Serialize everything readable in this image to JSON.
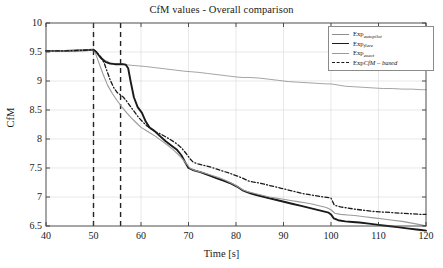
{
  "chart_data": {
    "type": "line",
    "title": "CfM values - Overall comparison",
    "xlabel": "Time [s]",
    "ylabel": "CfM",
    "xlim": [
      40,
      120
    ],
    "ylim": [
      6.5,
      10
    ],
    "xticks": [
      40,
      50,
      60,
      70,
      80,
      90,
      100,
      110,
      120
    ],
    "yticks": [
      6.5,
      7,
      7.5,
      8,
      8.5,
      9,
      9.5,
      10
    ],
    "xtick_labels": [
      "40",
      "50",
      "60",
      "70",
      "80",
      "90",
      "100",
      "110",
      "120"
    ],
    "ytick_labels": [
      "6.5",
      "7",
      "7.5",
      "8",
      "8.5",
      "9",
      "9.5",
      "10"
    ],
    "grid": true,
    "legend_position": "top-right",
    "annotations": [
      {
        "type": "vline",
        "x": 50,
        "style": "dashed",
        "color": "#222222"
      },
      {
        "type": "vline",
        "x": 55.7,
        "style": "dashed",
        "color": "#222222"
      }
    ],
    "series": [
      {
        "name": "Exp_autopilot",
        "label_main": "Exp",
        "label_sub": "autopilot",
        "color": "#8d8d8d",
        "width": 0.8,
        "dash": "solid",
        "x": [
          40,
          44,
          48,
          50,
          50.6,
          51.4,
          52.4,
          53.4,
          54.4,
          55.4,
          56.2,
          57.0,
          58.0,
          59.5,
          61,
          63,
          65,
          67,
          69,
          70.5,
          72,
          74,
          76,
          78,
          80,
          81.5,
          83,
          85,
          87,
          89,
          91,
          93,
          95,
          97,
          99,
          100,
          101.5,
          103,
          105,
          107,
          109,
          111,
          113,
          115,
          117,
          119,
          120
        ],
        "y": [
          9.52,
          9.52,
          9.53,
          9.54,
          9.5,
          9.42,
          9.36,
          9.32,
          9.3,
          9.29,
          9.29,
          9.28,
          9.27,
          9.26,
          9.25,
          9.23,
          9.21,
          9.19,
          9.17,
          9.16,
          9.15,
          9.13,
          9.11,
          9.09,
          9.07,
          9.06,
          9.06,
          9.05,
          9.03,
          9.01,
          8.99,
          8.98,
          8.97,
          8.96,
          8.95,
          8.95,
          8.93,
          8.91,
          8.9,
          8.89,
          8.88,
          8.87,
          8.87,
          8.86,
          8.86,
          8.85,
          8.85
        ]
      },
      {
        "name": "Exp_flare",
        "label_main": "Exp",
        "label_sub": "flare",
        "color": "#1a1a1a",
        "width": 1.9,
        "dash": "solid",
        "x": [
          40,
          44,
          48,
          50,
          50.6,
          51.5,
          52.5,
          53.5,
          54.5,
          55.4,
          56.2,
          56.8,
          57.3,
          57.8,
          58.5,
          59.3,
          60.2,
          61,
          61.8,
          62.8,
          64,
          65.2,
          66.5,
          67.5,
          68.5,
          69.3,
          70,
          70.8,
          71.5,
          72.5,
          73.5,
          74.5,
          76,
          77.5,
          79,
          80.2,
          81.3,
          82.2,
          83.2,
          84.5,
          86,
          87.5,
          89,
          90.5,
          92,
          93.5,
          95,
          96.5,
          98,
          99.5,
          100,
          100.6,
          101.5,
          103,
          104.5,
          106,
          108,
          110,
          112,
          114,
          116,
          118,
          119,
          120
        ],
        "y": [
          9.52,
          9.52,
          9.53,
          9.54,
          9.5,
          9.4,
          9.33,
          9.3,
          9.29,
          9.29,
          9.29,
          9.28,
          9.22,
          9.0,
          8.72,
          8.55,
          8.45,
          8.3,
          8.2,
          8.14,
          8.05,
          7.96,
          7.88,
          7.82,
          7.72,
          7.6,
          7.5,
          7.47,
          7.45,
          7.43,
          7.4,
          7.37,
          7.32,
          7.28,
          7.23,
          7.18,
          7.12,
          7.09,
          7.06,
          7.03,
          7.0,
          6.97,
          6.94,
          6.91,
          6.88,
          6.85,
          6.82,
          6.79,
          6.76,
          6.73,
          6.7,
          6.63,
          6.6,
          6.58,
          6.57,
          6.56,
          6.54,
          6.52,
          6.5,
          6.48,
          6.46,
          6.44,
          6.43,
          6.42
        ]
      },
      {
        "name": "Exp_exact",
        "label_main": "Exp",
        "label_sub": "exact",
        "color": "#9a9a9a",
        "width": 1.1,
        "dash": "solid",
        "x": [
          40,
          44,
          48,
          50,
          50.5,
          51.2,
          52,
          53,
          54,
          55,
          56,
          57,
          58,
          59,
          60,
          61,
          62,
          63,
          64,
          65.5,
          67,
          68.5,
          69.5,
          70.3,
          71.2,
          72.2,
          73.5,
          75,
          76.5,
          78,
          79.5,
          80.5,
          81.5,
          82.5,
          84,
          85.5,
          87,
          88.5,
          90,
          91.5,
          93,
          94.5,
          96,
          97.5,
          99,
          100,
          100.8,
          102,
          103.5,
          105,
          107,
          109,
          111,
          113,
          115,
          117,
          119,
          120
        ],
        "y": [
          9.52,
          9.52,
          9.53,
          9.54,
          9.46,
          9.3,
          9.12,
          8.92,
          8.78,
          8.66,
          8.55,
          8.45,
          8.36,
          8.28,
          8.2,
          8.15,
          8.1,
          8.05,
          7.99,
          7.9,
          7.8,
          7.68,
          7.58,
          7.5,
          7.46,
          7.44,
          7.41,
          7.37,
          7.33,
          7.28,
          7.22,
          7.17,
          7.12,
          7.09,
          7.06,
          7.03,
          7.0,
          6.98,
          6.96,
          6.94,
          6.92,
          6.9,
          6.88,
          6.85,
          6.82,
          6.78,
          6.72,
          6.7,
          6.69,
          6.68,
          6.66,
          6.64,
          6.62,
          6.6,
          6.58,
          6.55,
          6.52,
          6.5
        ]
      },
      {
        "name": "ExpCfM-based",
        "label_main": "Exp",
        "label_em": "CfM – based",
        "color": "#1a1a1a",
        "width": 1.3,
        "dash": "dashdot",
        "x": [
          40,
          44,
          48,
          50,
          50.6,
          51.5,
          52.3,
          52.8,
          53.5,
          54.3,
          55,
          55.7,
          56.3,
          57,
          57.8,
          58.6,
          59.5,
          60.3,
          61.2,
          62.2,
          63.2,
          64.5,
          66,
          67.3,
          68.5,
          69.5,
          70.3,
          71,
          72,
          73,
          74.5,
          76,
          77.5,
          79,
          80.3,
          81.5,
          82.5,
          83.5,
          85,
          86.5,
          88,
          89.5,
          91,
          92.5,
          94,
          95.5,
          97,
          98.5,
          99.5,
          100,
          100.7,
          102,
          103.5,
          105,
          107,
          109,
          111,
          113,
          115,
          117,
          119,
          120
        ],
        "y": [
          9.52,
          9.52,
          9.53,
          9.54,
          9.5,
          9.42,
          9.3,
          9.18,
          9.02,
          8.88,
          8.8,
          8.76,
          8.72,
          8.65,
          8.56,
          8.47,
          8.37,
          8.3,
          8.23,
          8.17,
          8.12,
          8.07,
          8.0,
          7.93,
          7.85,
          7.75,
          7.66,
          7.6,
          7.57,
          7.55,
          7.52,
          7.48,
          7.44,
          7.4,
          7.36,
          7.32,
          7.28,
          7.26,
          7.24,
          7.21,
          7.18,
          7.15,
          7.12,
          7.09,
          7.06,
          7.04,
          7.02,
          7.0,
          6.99,
          6.98,
          6.86,
          6.83,
          6.81,
          6.79,
          6.77,
          6.75,
          6.74,
          6.73,
          6.72,
          6.71,
          6.7,
          6.7
        ]
      }
    ]
  },
  "legend": {
    "items": [
      {
        "main": "Exp",
        "sub": "autopilot",
        "em": ""
      },
      {
        "main": "Exp",
        "sub": "flare",
        "em": ""
      },
      {
        "main": "Exp",
        "sub": "exact",
        "em": ""
      },
      {
        "main": "Exp",
        "sub": "",
        "em": "CfM – based"
      }
    ]
  }
}
